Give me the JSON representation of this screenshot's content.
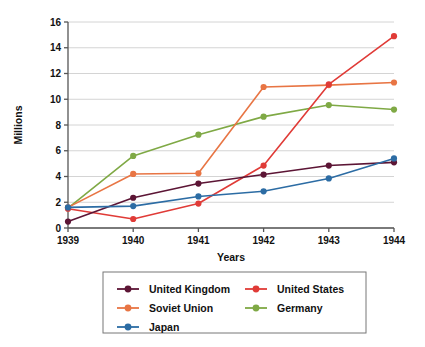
{
  "chart_data": {
    "type": "line",
    "title": "",
    "xlabel": "Years",
    "ylabel": "Millions",
    "categories": [
      "1939",
      "1940",
      "1941",
      "1942",
      "1943",
      "1944"
    ],
    "x": [
      1939,
      1940,
      1941,
      1942,
      1943,
      1944
    ],
    "xlim": [
      1939,
      1944
    ],
    "ylim": [
      0,
      16
    ],
    "y_ticks": [
      0,
      2,
      4,
      6,
      8,
      10,
      12,
      14,
      16
    ],
    "x_ticks": [
      "1939",
      "1940",
      "1941",
      "1942",
      "1943",
      "1944"
    ],
    "grid": true,
    "legend_position": "bottom",
    "series": [
      {
        "name": "United Kingdom",
        "color": "#5C1535",
        "values": [
          0.5,
          2.35,
          3.45,
          4.15,
          4.85,
          5.1
        ]
      },
      {
        "name": "United States",
        "color": "#E03B37",
        "values": [
          1.5,
          0.7,
          1.9,
          4.85,
          11.15,
          14.9
        ]
      },
      {
        "name": "Soviet Union",
        "color": "#E87544",
        "values": [
          1.6,
          4.2,
          4.25,
          10.95,
          11.1,
          11.3
        ]
      },
      {
        "name": "Germany",
        "color": "#7FA945",
        "values": [
          1.55,
          5.6,
          7.25,
          8.65,
          9.55,
          9.2
        ]
      },
      {
        "name": "Japan",
        "color": "#2C6CA4",
        "values": [
          1.6,
          1.7,
          2.45,
          2.85,
          3.85,
          5.4
        ]
      }
    ]
  },
  "axes": {
    "y_axis_title": "Millions",
    "x_axis_title": "Years",
    "y_tick_labels": [
      "0",
      "2",
      "4",
      "6",
      "8",
      "10",
      "12",
      "14",
      "16"
    ],
    "x_tick_labels": [
      "1939",
      "1940",
      "1941",
      "1942",
      "1943",
      "1944"
    ]
  },
  "legend": {
    "entries": [
      {
        "label": "United Kingdom",
        "color": "#5C1535"
      },
      {
        "label": "United States",
        "color": "#E03B37"
      },
      {
        "label": "Soviet Union",
        "color": "#E87544"
      },
      {
        "label": "Germany",
        "color": "#7FA945"
      },
      {
        "label": "Japan",
        "color": "#2C6CA4"
      }
    ]
  },
  "style": {
    "grid_color": "#D4D4D4",
    "axis_color": "#555555",
    "legend_border_color": "#777777",
    "background": "#FFFFFF"
  }
}
